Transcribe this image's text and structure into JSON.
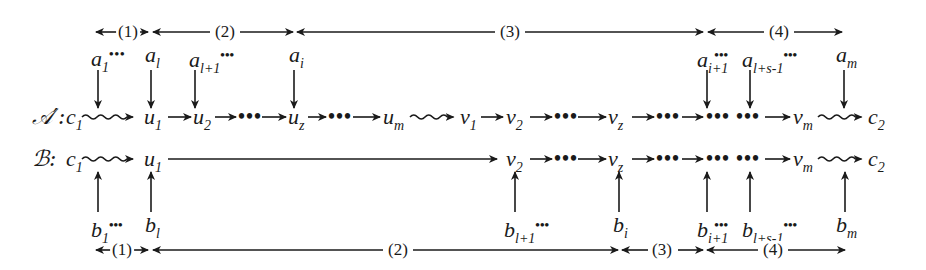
{
  "diagram": {
    "top_ranges": [
      {
        "label": "(1)",
        "x1": 96,
        "x2": 148,
        "lx": 128
      },
      {
        "label": "(2)",
        "x1": 153,
        "x2": 293,
        "lx": 225
      },
      {
        "label": "(3)",
        "x1": 297,
        "x2": 703,
        "lx": 510
      },
      {
        "label": "(4)",
        "x1": 708,
        "x2": 842,
        "lx": 779
      }
    ],
    "bottom_ranges": [
      {
        "label": "(1)",
        "x1": 96,
        "x2": 148,
        "lx": 122
      },
      {
        "label": "(2)",
        "x1": 153,
        "x2": 618,
        "lx": 398
      },
      {
        "label": "(3)",
        "x1": 622,
        "x2": 703,
        "lx": 662
      },
      {
        "label": "(4)",
        "x1": 707,
        "x2": 845,
        "lx": 773
      }
    ],
    "a_labels": [
      {
        "base": "a",
        "sub": "1",
        "dots": "•••",
        "x": 92
      },
      {
        "base": "a",
        "sub": "l",
        "dots": "",
        "x": 146
      },
      {
        "base": "a",
        "sub": "l+1",
        "dots": "•••",
        "x": 190
      },
      {
        "base": "a",
        "sub": "i",
        "dots": "",
        "x": 290
      },
      {
        "base": "a",
        "sub": "i+1",
        "dots": "•••",
        "x": 697
      },
      {
        "base": "a",
        "sub": "l+s-1",
        "dots": "•••",
        "x": 741
      },
      {
        "base": "a",
        "sub": "m",
        "dots": "",
        "x": 835
      }
    ],
    "b_labels": [
      {
        "base": "b",
        "sub": "1",
        "dots": "•••",
        "x": 92
      },
      {
        "base": "b",
        "sub": "l",
        "dots": "",
        "x": 146
      },
      {
        "base": "b",
        "sub": "l+1",
        "dots": "•••",
        "x": 504
      },
      {
        "base": "b",
        "sub": "i",
        "dots": "",
        "x": 614
      },
      {
        "base": "b",
        "sub": "i+1",
        "dots": "•••",
        "x": 697
      },
      {
        "base": "b",
        "sub": "l+s-1",
        "dots": "•••",
        "x": 741
      },
      {
        "base": "b",
        "sub": "m",
        "dots": "",
        "x": 835
      }
    ],
    "row_a": {
      "name": "𝒜′:",
      "nodes": [
        {
          "base": "c",
          "sub": "1",
          "x": 66
        },
        {
          "base": "u",
          "sub": "1",
          "x": 146
        },
        {
          "base": "u",
          "sub": "2",
          "x": 193
        },
        {
          "base": "u",
          "sub": "z",
          "x": 288
        },
        {
          "base": "u",
          "sub": "m",
          "x": 383
        },
        {
          "base": "v",
          "sub": "1",
          "x": 460
        },
        {
          "base": "v",
          "sub": "2",
          "x": 506
        },
        {
          "base": "v",
          "sub": "z",
          "x": 614
        },
        {
          "base": "v",
          "sub": "m",
          "x": 793
        },
        {
          "base": "c",
          "sub": "2",
          "x": 868
        }
      ],
      "ellipses": [
        "•••",
        "•••",
        "•••",
        "•••",
        "••• •••"
      ]
    },
    "row_b": {
      "name": "ℬ:",
      "nodes": [
        {
          "base": "c",
          "sub": "1",
          "x": 66
        },
        {
          "base": "u",
          "sub": "1",
          "x": 146
        },
        {
          "base": "v",
          "sub": "2",
          "x": 506
        },
        {
          "base": "v",
          "sub": "z",
          "x": 614
        },
        {
          "base": "v",
          "sub": "m",
          "x": 793
        },
        {
          "base": "c",
          "sub": "2",
          "x": 868
        }
      ],
      "ellipses": [
        "•••",
        "•••",
        "••• •••"
      ]
    }
  }
}
